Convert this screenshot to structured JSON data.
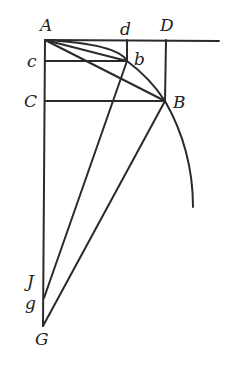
{
  "diagram": {
    "type": "geometric-construction",
    "colors": {
      "stroke": "#2a2a2a",
      "label": "#222222",
      "background": "#ffffff"
    },
    "points": {
      "A": {
        "label": "A",
        "x": 45,
        "y": 40,
        "lx": 40,
        "ly": 31
      },
      "d": {
        "label": "d",
        "x": 127,
        "y": 40,
        "lx": 120,
        "ly": 35
      },
      "D": {
        "label": "D",
        "x": 166,
        "y": 40,
        "lx": 160,
        "ly": 31
      },
      "c": {
        "label": "c",
        "x": 45,
        "y": 61,
        "lx": 27,
        "ly": 67
      },
      "b": {
        "label": "b",
        "x": 127,
        "y": 61,
        "lx": 134,
        "ly": 65
      },
      "C": {
        "label": "C",
        "x": 45,
        "y": 101,
        "lx": 24,
        "ly": 107
      },
      "B": {
        "label": "B",
        "x": 165,
        "y": 101,
        "lx": 173,
        "ly": 108
      },
      "J": {
        "label": "J",
        "x": 44,
        "y": 298,
        "lx": 27,
        "ly": 287
      },
      "g": {
        "label": "g",
        "x": 44,
        "y": 298,
        "lx": 25,
        "ly": 309
      },
      "G": {
        "label": "G",
        "x": 43,
        "y": 326,
        "lx": 35,
        "ly": 345
      }
    },
    "segments": [
      {
        "name": "top-horizontal-line",
        "from": [
          45,
          40
        ],
        "to": [
          219,
          41
        ]
      },
      {
        "name": "left-vertical-line",
        "from": [
          45,
          40
        ],
        "to": [
          43,
          326
        ]
      },
      {
        "name": "segment-c-b",
        "from": [
          45,
          61
        ],
        "to": [
          127,
          61
        ]
      },
      {
        "name": "segment-d-b",
        "from": [
          127,
          40
        ],
        "to": [
          127,
          61
        ]
      },
      {
        "name": "segment-C-B",
        "from": [
          45,
          101
        ],
        "to": [
          165,
          101
        ]
      },
      {
        "name": "segment-D-B",
        "from": [
          166,
          40
        ],
        "to": [
          165,
          101
        ]
      },
      {
        "name": "chord-A-b",
        "from": [
          45,
          40
        ],
        "to": [
          127,
          61
        ]
      },
      {
        "name": "chord-A-B",
        "from": [
          45,
          40
        ],
        "to": [
          165,
          101
        ]
      },
      {
        "name": "segment-b-g",
        "from": [
          127,
          61
        ],
        "to": [
          44,
          298
        ]
      },
      {
        "name": "segment-B-G",
        "from": [
          165,
          101
        ],
        "to": [
          43,
          326
        ]
      }
    ],
    "arc": {
      "name": "circular-arc-A-b-B",
      "path": "M45,40 Q118,44 127,61 Q150,78 165,101 Q193,150 193,207"
    }
  }
}
